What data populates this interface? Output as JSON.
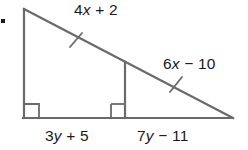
{
  "figure": {
    "background_color": "#ffffff",
    "stroke_color": "#6a6a6a",
    "text_color": "#1a1a1a",
    "problem_marker": "."
  },
  "labels": {
    "top_side": {
      "coefficient": "4",
      "variable": "x",
      "operator": "+",
      "constant": "2",
      "full": "4x + 2"
    },
    "right_side": {
      "coefficient": "6",
      "variable": "x",
      "operator": "−",
      "constant": "10",
      "full": "6x − 10"
    },
    "bottom_left": {
      "coefficient": "3",
      "variable": "y",
      "operator": "+",
      "constant": "5",
      "full": "3y + 5"
    },
    "bottom_right": {
      "coefficient": "7",
      "variable": "y",
      "operator": "−",
      "constant": "11",
      "full": "7y − 11"
    }
  },
  "marks": {
    "right_angle_count": 2,
    "congruence_tick_count": 2
  },
  "chart_data": {
    "type": "diagram",
    "shape": "right triangle with interior vertical segment (altitude-like) forming two similar right triangles",
    "vertices": {
      "top_left": [
        24,
        9
      ],
      "bottom_left": [
        24,
        118
      ],
      "bottom_right": [
        232,
        118
      ],
      "interior_top": [
        125,
        62
      ],
      "interior_bottom": [
        125,
        118
      ]
    },
    "segments": [
      {
        "name": "left-leg",
        "from": "top_left",
        "to": "bottom_left"
      },
      {
        "name": "base",
        "from": "bottom_left",
        "to": "bottom_right"
      },
      {
        "name": "hypotenuse",
        "from": "top_left",
        "to": "bottom_right"
      },
      {
        "name": "interior-vertical",
        "from": "interior_top",
        "to": "interior_bottom"
      }
    ],
    "labeled_segments": [
      {
        "segment": "hypotenuse-upper",
        "label": "4x + 2"
      },
      {
        "segment": "hypotenuse-lower",
        "label": "6x − 10"
      },
      {
        "segment": "base-left",
        "label": "3y + 5"
      },
      {
        "segment": "base-right",
        "label": "7y − 11"
      }
    ],
    "right_angle_markers": [
      {
        "at": "bottom_left",
        "position": [
          24,
          118
        ]
      },
      {
        "at": "interior_bottom",
        "position": [
          125,
          118
        ]
      }
    ],
    "congruence_ticks": [
      {
        "on": "hypotenuse-upper",
        "position": [
          76,
          40
        ]
      },
      {
        "on": "hypotenuse-lower",
        "position": [
          176,
          84
        ]
      }
    ]
  }
}
